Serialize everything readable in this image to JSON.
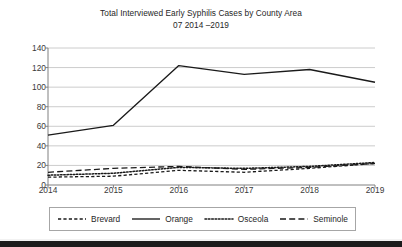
{
  "chart_data": {
    "type": "line",
    "title": "Total Interviewed Early Syphilis Cases by County Area",
    "subtitle": "07 2014 –2019",
    "xlabel": "",
    "ylabel": "",
    "categories": [
      "2014",
      "2015",
      "2016",
      "2017",
      "2018",
      "2019"
    ],
    "ylim": [
      0,
      140
    ],
    "ytick_step": 20,
    "yticks": [
      "0",
      "20",
      "40",
      "60",
      "80",
      "100",
      "120",
      "140"
    ],
    "grid": "horizontal",
    "legend_position": "bottom",
    "series": [
      {
        "name": "Brevard",
        "style": "dashed",
        "color": "#1a1a1a",
        "values": [
          8,
          9,
          15,
          13,
          17,
          22
        ]
      },
      {
        "name": "Orange",
        "style": "solid",
        "color": "#1a1a1a",
        "values": [
          51,
          61,
          122,
          113,
          118,
          105
        ]
      },
      {
        "name": "Osceola",
        "style": "dotted",
        "color": "#1a1a1a",
        "values": [
          10,
          12,
          18,
          17,
          19,
          23
        ]
      },
      {
        "name": "Seminole",
        "style": "longdash",
        "color": "#1a1a1a",
        "values": [
          13,
          17,
          19,
          16,
          18,
          22
        ]
      }
    ]
  },
  "legend": {
    "items": [
      {
        "label": "Brevard",
        "icon": "dashed-line-swatch"
      },
      {
        "label": "Orange",
        "icon": "solid-line-swatch"
      },
      {
        "label": "Osceola",
        "icon": "dotted-line-swatch"
      },
      {
        "label": "Seminole",
        "icon": "longdash-line-swatch"
      }
    ]
  },
  "colors": {
    "line": "#1a1a1a",
    "grid": "#bfbfbf",
    "axis": "#808080",
    "text": "#262626",
    "background": "#ffffff",
    "band": "#1c1c1c"
  }
}
